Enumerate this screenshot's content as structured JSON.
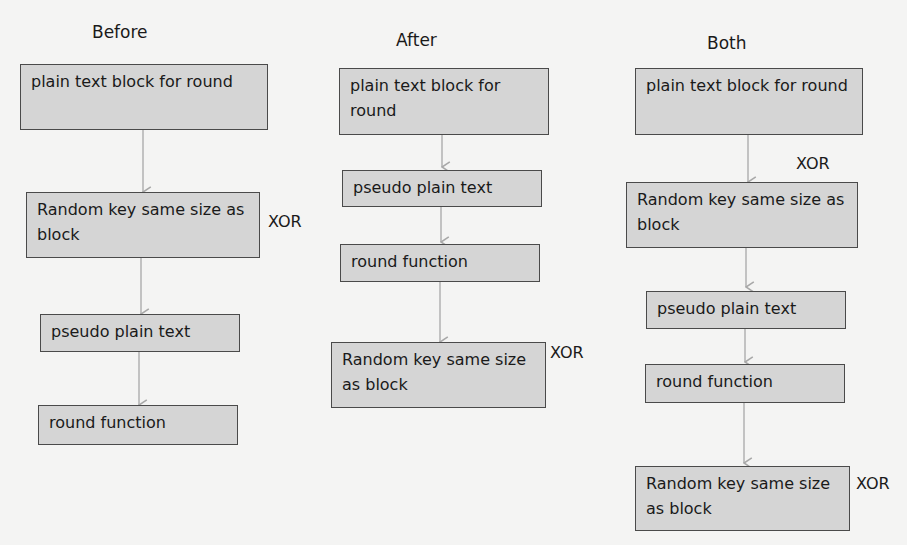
{
  "columns": [
    {
      "title": "Before",
      "boxes": [
        "plain text block for round",
        "Random key same size as block",
        "pseudo plain text",
        "round function"
      ],
      "xor_label": "XOR"
    },
    {
      "title": "After",
      "boxes": [
        "plain text block for round",
        "pseudo plain text",
        "round function",
        "Random key same size as block"
      ],
      "xor_label": "XOR"
    },
    {
      "title": "Both",
      "boxes": [
        "plain text block for round",
        "Random key same size as block",
        "pseudo plain text",
        "round function",
        "Random key same size as block"
      ],
      "xor_labels": [
        "XOR",
        "XOR"
      ]
    }
  ],
  "colors": {
    "box_fill": "#d5d5d5",
    "box_border": "#4a4a4a",
    "arrow": "#a8a8a8",
    "background": "#f4f4f3"
  }
}
